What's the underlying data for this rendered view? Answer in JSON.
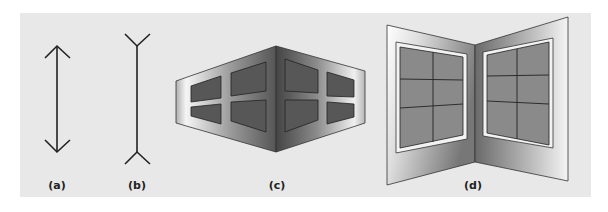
{
  "figure": {
    "panel_background": "#e8e8e8",
    "line_color": "#222222",
    "panels": [
      {
        "id": "a",
        "label": "(a)",
        "content": "vertical line with inward-pointing arrowheads"
      },
      {
        "id": "b",
        "label": "(b)",
        "content": "vertical line with outward-pointing fins"
      },
      {
        "id": "c",
        "label": "(c)",
        "content": "outside corner of a building with windows"
      },
      {
        "id": "d",
        "label": "(d)",
        "content": "inside corner of a room with windows"
      }
    ]
  }
}
